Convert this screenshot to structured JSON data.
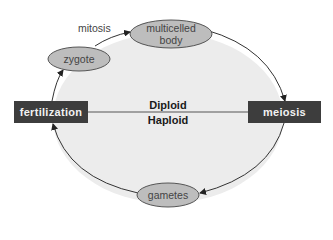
{
  "diagram": {
    "nodes": {
      "fertilization": "fertilization",
      "meiosis": "meiosis",
      "zygote": "zygote",
      "multicelled_body": {
        "line1": "multicelled",
        "line2": "body"
      },
      "gametes": "gametes"
    },
    "edge_labels": {
      "mitosis": "mitosis"
    },
    "phases": {
      "upper": "Diploid",
      "lower": "Haploid"
    },
    "flow": [
      "fertilization -> zygote",
      "zygote -> multicelled body (mitosis)",
      "multicelled body -> meiosis",
      "meiosis -> gametes",
      "gametes -> fertilization"
    ],
    "colors": {
      "box_fill": "#3d3d3d",
      "oval_fill": "#bdbdbd",
      "cycle_fill": "#ececec",
      "line": "#333333"
    }
  }
}
